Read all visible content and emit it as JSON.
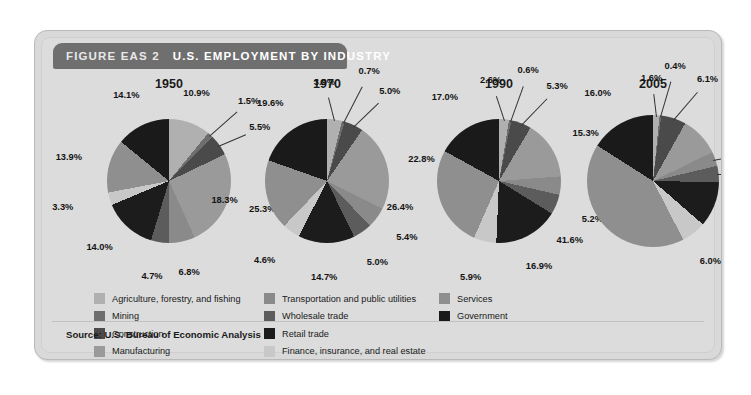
{
  "figure": {
    "label": "FIGURE EAS 2",
    "title": "U.S. EMPLOYMENT BY INDUSTRY",
    "source": "Source: U.S. Bureau of Economic Analysis"
  },
  "colors": {
    "agriculture": "#b0b0b0",
    "mining": "#6e6e6e",
    "construction": "#4a4a4a",
    "manufacturing": "#9a9a9a",
    "transportation": "#8a8a8a",
    "wholesale": "#5c5c5c",
    "retail": "#1c1c1c",
    "services": "#8f8f8f",
    "government": "#1a1a1a",
    "finance": "#c8c8c8",
    "panel_bg": "#dcdcdc",
    "header_bg": "#6f6f6f"
  },
  "legend": {
    "columns": [
      {
        "items": [
          {
            "label": "Agriculture, forestry, and fishing",
            "color": "#b0b0b0",
            "key": "agriculture"
          },
          {
            "label": "Mining",
            "color": "#6e6e6e",
            "key": "mining"
          },
          {
            "label": "Construction",
            "color": "#4a4a4a",
            "key": "construction"
          },
          {
            "label": "Manufacturing",
            "color": "#9a9a9a",
            "key": "manufacturing"
          }
        ]
      },
      {
        "items": [
          {
            "label": "Transportation and public utilities",
            "color": "#8a8a8a",
            "key": "transportation"
          },
          {
            "label": "Wholesale trade",
            "color": "#5c5c5c",
            "key": "wholesale"
          },
          {
            "label": "Retail trade",
            "color": "#1c1c1c",
            "key": "retail"
          },
          {
            "label": "Finance, insurance, and real estate",
            "color": "#c8c8c8",
            "key": "finance"
          }
        ]
      },
      {
        "items": [
          {
            "label": "Services",
            "color": "#8f8f8f",
            "key": "services"
          },
          {
            "label": "Government",
            "color": "#1a1a1a",
            "key": "government"
          }
        ]
      }
    ]
  },
  "chart_data": [
    {
      "type": "pie",
      "title": "1950",
      "categories": [
        "Agriculture, forestry, and fishing",
        "Mining",
        "Construction",
        "Manufacturing",
        "Transportation and public utilities",
        "Wholesale trade",
        "Retail trade",
        "Finance, insurance, and real estate",
        "Services",
        "Government"
      ],
      "values": [
        10.9,
        1.5,
        5.5,
        25.3,
        6.8,
        4.7,
        14.0,
        3.3,
        13.9,
        14.1
      ],
      "labels": [
        "10.9%",
        "1.5%",
        "5.5%",
        "25.3%",
        "6.8%",
        "4.7%",
        "14.0%",
        "3.3%",
        "13.9%",
        "14.1%"
      ],
      "colors": [
        "#b0b0b0",
        "#6e6e6e",
        "#4a4a4a",
        "#9a9a9a",
        "#8a8a8a",
        "#5c5c5c",
        "#1c1c1c",
        "#c8c8c8",
        "#8f8f8f",
        "#1a1a1a"
      ],
      "units": "percent"
    },
    {
      "type": "pie",
      "title": "1970",
      "categories": [
        "Agriculture, forestry, and fishing",
        "Mining",
        "Construction",
        "Manufacturing",
        "Transportation and public utilities",
        "Wholesale trade",
        "Retail trade",
        "Finance, insurance, and real estate",
        "Services",
        "Government"
      ],
      "values": [
        3.9,
        0.7,
        5.0,
        22.8,
        5.4,
        5.0,
        14.7,
        4.6,
        18.3,
        19.6
      ],
      "labels": [
        "3.9%",
        "0.7%",
        "5.0%",
        "22.8%",
        "5.4%",
        "5.0%",
        "14.7%",
        "4.6%",
        "18.3%",
        "19.6%"
      ],
      "colors": [
        "#b0b0b0",
        "#6e6e6e",
        "#4a4a4a",
        "#9a9a9a",
        "#8a8a8a",
        "#5c5c5c",
        "#1c1c1c",
        "#c8c8c8",
        "#8f8f8f",
        "#1a1a1a"
      ],
      "units": "percent"
    },
    {
      "type": "pie",
      "title": "1990",
      "categories": [
        "Agriculture, forestry, and fishing",
        "Mining",
        "Construction",
        "Manufacturing",
        "Transportation and public utilities",
        "Wholesale trade",
        "Retail trade",
        "Finance, insurance, and real estate",
        "Services",
        "Government"
      ],
      "values": [
        2.6,
        0.6,
        5.3,
        15.3,
        4.8,
        5.2,
        16.9,
        5.9,
        26.4,
        17.0
      ],
      "labels": [
        "2.6%",
        "0.6%",
        "5.3%",
        "15.3%",
        "4.8%",
        "5.2%",
        "16.9%",
        "5.9%",
        "26.4%",
        "17.0%"
      ],
      "colors": [
        "#b0b0b0",
        "#6e6e6e",
        "#4a4a4a",
        "#9a9a9a",
        "#8a8a8a",
        "#5c5c5c",
        "#1c1c1c",
        "#c8c8c8",
        "#8f8f8f",
        "#1a1a1a"
      ],
      "units": "percent"
    },
    {
      "type": "pie",
      "title": "2005",
      "categories": [
        "Agriculture, forestry, and fishing",
        "Mining",
        "Construction",
        "Manufacturing",
        "Transportation and public utilities",
        "Wholesale trade",
        "Retail trade",
        "Finance, insurance, and real estate",
        "Services",
        "Government"
      ],
      "values": [
        1.6,
        0.4,
        6.1,
        9.7,
        3.5,
        4.0,
        11.1,
        6.0,
        41.6,
        16.0
      ],
      "labels": [
        "1.6%",
        "0.4%",
        "6.1%",
        "9.7%",
        "3.5%",
        "4.0%",
        "11.1%",
        "6.0%",
        "41.6%",
        "16.0%"
      ],
      "colors": [
        "#b0b0b0",
        "#6e6e6e",
        "#4a4a4a",
        "#9a9a9a",
        "#8a8a8a",
        "#5c5c5c",
        "#1c1c1c",
        "#c8c8c8",
        "#8f8f8f",
        "#1a1a1a"
      ],
      "units": "percent"
    }
  ]
}
